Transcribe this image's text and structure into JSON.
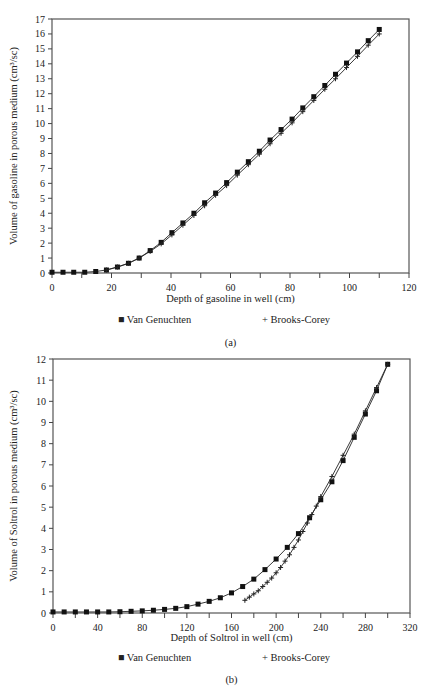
{
  "chart_data": [
    {
      "type": "line",
      "panel_label": "(a)",
      "xlabel": "Depth of gasoline in well (cm)",
      "ylabel": "Volume of gasoline in porous medium (cm³/sc)",
      "xlim": [
        0,
        120
      ],
      "ylim": [
        0,
        17
      ],
      "xticks": [
        0,
        20,
        40,
        60,
        80,
        100,
        120
      ],
      "yticks": [
        0,
        1,
        2,
        3,
        4,
        5,
        6,
        7,
        8,
        9,
        10,
        11,
        12,
        13,
        14,
        15,
        16,
        17
      ],
      "legend": [
        "■ Van Genuchten",
        "+ Brooks-Corey"
      ],
      "series": [
        {
          "name": "Van Genuchten",
          "marker": "square",
          "x": [
            0,
            3.7,
            7.3,
            11,
            14.7,
            18.3,
            22,
            25.7,
            29.3,
            33,
            36.7,
            40.3,
            44,
            47.7,
            51.3,
            55,
            58.7,
            62.3,
            66,
            69.7,
            73.3,
            77,
            80.7,
            84.3,
            88,
            91.7,
            95.3,
            99,
            102.7,
            106.3,
            110
          ],
          "y": [
            0.05,
            0.05,
            0.05,
            0.05,
            0.1,
            0.2,
            0.4,
            0.65,
            1.0,
            1.5,
            2.05,
            2.7,
            3.35,
            4.0,
            4.7,
            5.35,
            6.05,
            6.75,
            7.45,
            8.15,
            8.9,
            9.6,
            10.3,
            11.05,
            11.8,
            12.55,
            13.3,
            14.05,
            14.8,
            15.55,
            16.3
          ]
        },
        {
          "name": "Brooks-Corey",
          "marker": "plus",
          "x": [
            18.3,
            22,
            25.7,
            29.3,
            33,
            36.7,
            40.3,
            44,
            47.7,
            51.3,
            55,
            58.7,
            62.3,
            66,
            69.7,
            73.3,
            77,
            80.7,
            84.3,
            88,
            91.7,
            95.3,
            99,
            102.7,
            106.3,
            110
          ],
          "y": [
            0.2,
            0.4,
            0.65,
            1.0,
            1.45,
            1.95,
            2.55,
            3.2,
            3.85,
            4.5,
            5.2,
            5.85,
            6.55,
            7.25,
            7.95,
            8.65,
            9.35,
            10.05,
            10.8,
            11.55,
            12.3,
            13.0,
            13.75,
            14.5,
            15.25,
            16.0
          ]
        }
      ]
    },
    {
      "type": "line",
      "panel_label": "(b)",
      "xlabel": "Depth of Soltrol in well (cm)",
      "ylabel": "Volume of Soltrol in porous medium (cm³/sc)",
      "xlim": [
        0,
        320
      ],
      "ylim": [
        0,
        12
      ],
      "xticks": [
        0,
        40,
        80,
        120,
        160,
        200,
        240,
        280,
        320
      ],
      "yticks": [
        0,
        1,
        2,
        3,
        4,
        5,
        6,
        7,
        8,
        9,
        10,
        11,
        12
      ],
      "legend": [
        "■ Van Genuchten",
        "+ Brooks-Corey"
      ],
      "series": [
        {
          "name": "Van Genuchten",
          "marker": "square",
          "x": [
            0,
            10,
            20,
            30,
            40,
            50,
            60,
            70,
            80,
            90,
            100,
            110,
            120,
            130,
            140,
            150,
            160,
            170,
            180,
            190,
            200,
            210,
            220,
            230,
            240,
            250,
            260,
            270,
            280,
            290,
            300
          ],
          "y": [
            0.05,
            0.05,
            0.05,
            0.05,
            0.05,
            0.05,
            0.06,
            0.08,
            0.1,
            0.13,
            0.17,
            0.22,
            0.3,
            0.42,
            0.55,
            0.72,
            0.95,
            1.25,
            1.6,
            2.05,
            2.55,
            3.1,
            3.75,
            4.5,
            5.35,
            6.2,
            7.2,
            8.3,
            9.4,
            10.5,
            11.75
          ]
        },
        {
          "name": "Brooks-Corey",
          "marker": "plus",
          "x": [
            172,
            176,
            180,
            184,
            188,
            192,
            196,
            200,
            204,
            208,
            212,
            216,
            220,
            224,
            228,
            232,
            236,
            240,
            250,
            260,
            270,
            280,
            290,
            300
          ],
          "y": [
            0.6,
            0.75,
            0.9,
            1.05,
            1.25,
            1.45,
            1.65,
            1.9,
            2.15,
            2.45,
            2.75,
            3.1,
            3.45,
            3.85,
            4.25,
            4.65,
            5.05,
            5.5,
            6.45,
            7.45,
            8.45,
            9.55,
            10.65,
            11.75
          ]
        }
      ]
    }
  ]
}
